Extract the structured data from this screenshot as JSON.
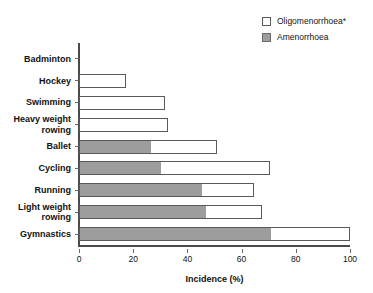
{
  "chart_data": {
    "type": "bar",
    "orientation": "horizontal",
    "stacked": true,
    "title": "",
    "xlabel": "Incidence (%)",
    "ylabel": "",
    "xlim": [
      0,
      100
    ],
    "xticks": [
      0,
      20,
      40,
      60,
      80,
      100
    ],
    "xtick_labels": [
      "0",
      "20",
      "40",
      "60",
      "80",
      "100"
    ],
    "grid": false,
    "legend_position": "top-right",
    "categories": [
      "Badminton",
      "Hockey",
      "Swimming",
      "Heavy weight\nrowing",
      "Ballet",
      "Cycling",
      "Running",
      "Light weight\nrowing",
      "Gymnastics"
    ],
    "series": [
      {
        "name": "Amenorrhoea",
        "color": "#9d9d9d",
        "values": [
          0,
          0,
          0,
          0,
          26.6,
          30.3,
          45.4,
          46.9,
          70.8
        ]
      },
      {
        "name": "Oligomenorrhoea*",
        "color": "#ffffff",
        "values": [
          0,
          17.3,
          31.7,
          32.8,
          24.3,
          40.2,
          19.2,
          20.6,
          29.2
        ]
      }
    ],
    "totals": [
      0,
      17.3,
      31.7,
      32.8,
      50.9,
      70.5,
      64.6,
      67.5,
      100.0
    ]
  },
  "legend": {
    "entries": [
      {
        "label": "Oligomenorrhoea*",
        "style": "hollow"
      },
      {
        "label": "Amenorrhoea",
        "style": "filled"
      }
    ]
  },
  "colors": {
    "amenorrhoea_fill": "#9d9d9d",
    "oligomenorrhoea_fill": "#ffffff",
    "bar_stroke": "#5a5a5a",
    "axis": "#4a4a4a",
    "text": "#111111"
  }
}
